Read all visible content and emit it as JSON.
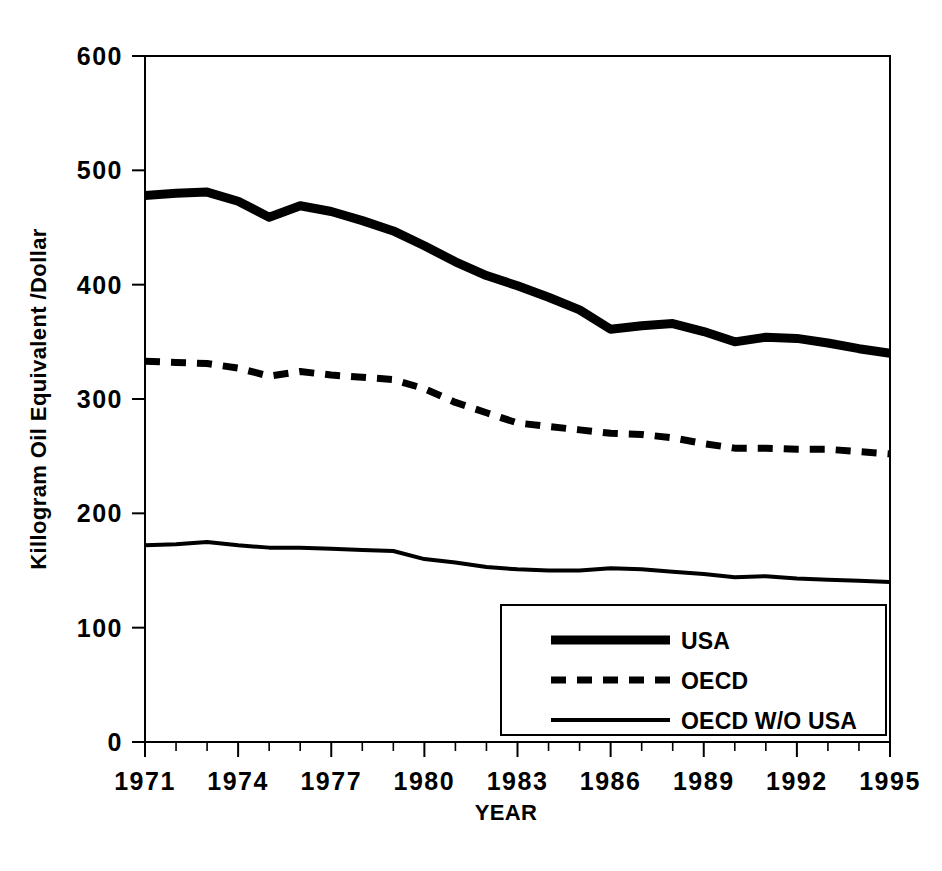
{
  "chart_data": {
    "type": "line",
    "title": "",
    "xlabel": "YEAR",
    "ylabel": "Killogram Oil Equivalent /Dollar",
    "xlim": [
      1971,
      1995
    ],
    "ylim": [
      0,
      600
    ],
    "ytick_labels": [
      "0",
      "100",
      "200",
      "300",
      "400",
      "500",
      "600"
    ],
    "ytick_values": [
      0,
      100,
      200,
      300,
      400,
      500,
      600
    ],
    "xtick_labels": [
      "1971",
      "1974",
      "1977",
      "1980",
      "1983",
      "1986",
      "1989",
      "1992",
      "1995"
    ],
    "xtick_values": [
      1971,
      1974,
      1977,
      1980,
      1983,
      1986,
      1989,
      1992,
      1995
    ],
    "x_minor_ticks_every": 1,
    "grid": false,
    "legend_position": "lower right",
    "x": [
      1971,
      1972,
      1973,
      1974,
      1975,
      1976,
      1977,
      1978,
      1979,
      1980,
      1981,
      1982,
      1983,
      1984,
      1985,
      1986,
      1987,
      1988,
      1989,
      1990,
      1991,
      1992,
      1993,
      1994,
      1995
    ],
    "series": [
      {
        "name": "USA",
        "style": "solid-thick",
        "values": [
          478,
          480,
          481,
          473,
          459,
          469,
          464,
          456,
          447,
          434,
          420,
          408,
          399,
          389,
          378,
          361,
          364,
          366,
          359,
          350,
          354,
          353,
          349,
          344,
          340
        ]
      },
      {
        "name": "OECD",
        "style": "dashed",
        "values": [
          333,
          332,
          331,
          327,
          320,
          324,
          321,
          319,
          317,
          309,
          297,
          288,
          279,
          276,
          273,
          270,
          269,
          266,
          261,
          257,
          257,
          256,
          256,
          254,
          252
        ]
      },
      {
        "name": "OECD W/O USA",
        "style": "solid-thin",
        "values": [
          172,
          173,
          175,
          172,
          170,
          170,
          169,
          168,
          167,
          160,
          157,
          153,
          151,
          150,
          150,
          152,
          151,
          149,
          147,
          144,
          145,
          143,
          142,
          141,
          140
        ]
      }
    ]
  },
  "legend": {
    "entries": [
      {
        "label": "USA",
        "style": "solid-thick"
      },
      {
        "label": "OECD",
        "style": "dashed"
      },
      {
        "label": "OECD W/O USA",
        "style": "solid-thin"
      }
    ]
  },
  "colors": {
    "ink": "#000000",
    "background": "#ffffff"
  }
}
